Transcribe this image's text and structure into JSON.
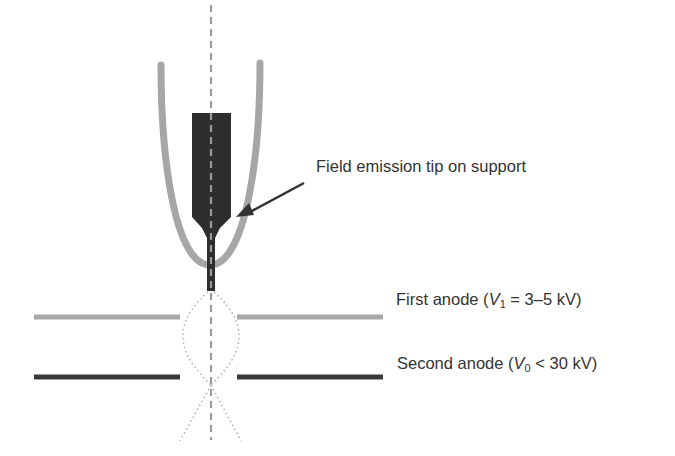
{
  "diagram": {
    "labels": {
      "tip": "Field emission tip on support",
      "first_anode": {
        "prefix": "First anode (",
        "var": "V",
        "sub": "1",
        "suffix": " = 3–5 kV)"
      },
      "second_anode": {
        "prefix": "Second anode (",
        "var": "V",
        "sub": "0",
        "suffix": " < 30 kV)"
      }
    },
    "colors": {
      "tip": "#2e2e2e",
      "suppressor": "#a6a6a6",
      "first_anode": "#a8a8a8",
      "second_anode": "#3a3a3a",
      "axis": "#9a9a9a",
      "beam": "#b0b0b0",
      "arrow": "#333333",
      "text": "#333333"
    }
  }
}
